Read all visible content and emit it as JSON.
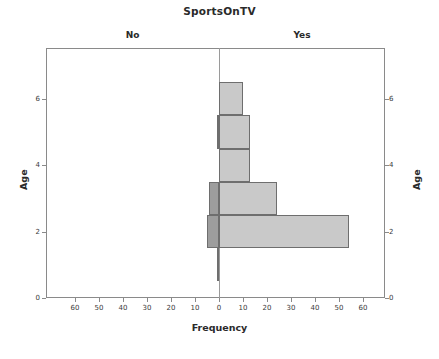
{
  "chart_data": {
    "type": "bar",
    "title": "SportsOnTV",
    "xlabel": "Frequency",
    "ylabel": "Age",
    "ylabel_right": "Age",
    "grid": false,
    "legend_position": "panel-headers",
    "panels": [
      "No",
      "Yes"
    ],
    "categories": [
      1,
      2,
      3,
      4,
      5,
      6
    ],
    "xticks_left": [
      "60",
      "50",
      "40",
      "30",
      "20",
      "10",
      "0"
    ],
    "xticks_right": [
      "0",
      "10",
      "20",
      "30",
      "40",
      "50",
      "60"
    ],
    "yticks": [
      "0",
      "2",
      "4",
      "6"
    ],
    "xlim": [
      -60,
      60
    ],
    "ylim": [
      0,
      7
    ],
    "series": [
      {
        "name": "No",
        "values": [
          1,
          5,
          4,
          0,
          1,
          0
        ]
      },
      {
        "name": "Yes",
        "values": [
          0,
          54,
          24,
          13,
          13,
          10
        ]
      }
    ],
    "colors": {
      "no": "#9d9d9d",
      "yes": "#c9c9c9",
      "border": "#6e6e6e",
      "axis": "#8a8a8a"
    }
  },
  "header": {
    "title": "SportsOnTV",
    "panel_no": "No",
    "panel_yes": "Yes"
  },
  "axes": {
    "x_title": "Frequency",
    "y_title_left": "Age",
    "y_title_right": "Age",
    "x_ticks": [
      "60",
      "50",
      "40",
      "30",
      "20",
      "10",
      "0",
      "10",
      "20",
      "30",
      "40",
      "50",
      "60"
    ],
    "y_ticks": [
      "6",
      "4",
      "2",
      "0"
    ]
  }
}
